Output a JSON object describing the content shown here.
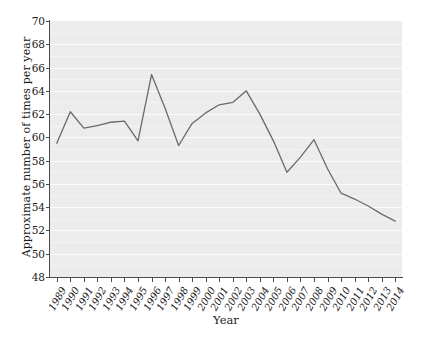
{
  "chart_data": {
    "type": "line",
    "title": "",
    "xlabel": "Year",
    "ylabel": "Approximate number of times per year",
    "categories": [
      "1989",
      "1990",
      "1991",
      "1992",
      "1993",
      "1994",
      "1995",
      "1996",
      "1997",
      "1998",
      "1999",
      "2000",
      "2001",
      "2002",
      "2003",
      "2004",
      "2005",
      "2006",
      "2007",
      "2008",
      "2009",
      "2010",
      "2011",
      "2012",
      "2013",
      "2014"
    ],
    "values": [
      59.5,
      62.2,
      60.8,
      61.0,
      61.3,
      61.4,
      59.7,
      65.4,
      62.5,
      59.3,
      61.2,
      62.1,
      62.8,
      63.0,
      64.0,
      62.0,
      59.7,
      57.0,
      58.3,
      59.8,
      57.3,
      55.2,
      54.7,
      54.1,
      53.4,
      52.8
    ],
    "x_tick_labels": [
      "1989",
      "1990",
      "1991",
      "1992",
      "1993",
      "1994",
      "1995",
      "1996",
      "1997",
      "1998",
      "1999",
      "2000",
      "2001",
      "2002",
      "2003",
      "2004",
      "2005",
      "2006",
      "2007",
      "2008",
      "2009",
      "2010",
      "2011",
      "2012",
      "2013",
      "2014"
    ],
    "y_tick_labels": [
      "70",
      "68",
      "66",
      "64",
      "62",
      "60",
      "58",
      "56",
      "54",
      "52",
      "50",
      "48"
    ],
    "y_tick_values": [
      70,
      68,
      66,
      64,
      62,
      60,
      58,
      56,
      54,
      52,
      50,
      48
    ],
    "ylim": [
      48,
      70
    ],
    "grid": true,
    "legend": "none",
    "series": [
      {
        "name": "Approximate number of times per year",
        "values": [
          59.5,
          62.2,
          60.8,
          61.0,
          61.3,
          61.4,
          59.7,
          65.4,
          62.5,
          59.3,
          61.2,
          62.1,
          62.8,
          63.0,
          64.0,
          62.0,
          59.7,
          57.0,
          58.3,
          59.8,
          57.3,
          55.2,
          54.7,
          54.1,
          53.4,
          52.8
        ],
        "color": "#6a6a6a"
      }
    ],
    "colors": {
      "line": "#6a6a6a",
      "panel_background": "#ececec",
      "gridline": "#fbfbfb",
      "axis": "#4a4a4a",
      "text": "#1a1a1a",
      "figure_background": "#ffffff"
    }
  }
}
